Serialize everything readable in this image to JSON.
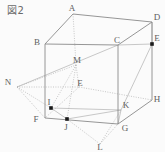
{
  "figure": {
    "caption": "図2",
    "type": "geometry-diagram",
    "shape": "cube with inscribed construction lines",
    "stroke_color": "#8a8a8a",
    "dotted_color": "#b0b0b0",
    "dot_color": "#1a1a1a",
    "background": "#fbfbfb",
    "width": 165,
    "height": 152
  },
  "vertices": [
    {
      "id": "A",
      "label": "A",
      "x": 73,
      "y": 14,
      "lx": 72,
      "ly": 8,
      "marked": false
    },
    {
      "id": "B",
      "label": "B",
      "x": 45,
      "y": 44,
      "lx": 37,
      "ly": 42,
      "marked": false
    },
    {
      "id": "C",
      "label": "C",
      "x": 118,
      "y": 45,
      "lx": 117,
      "ly": 40,
      "marked": false
    },
    {
      "id": "D",
      "label": "D",
      "x": 152,
      "y": 22,
      "lx": 157,
      "ly": 17,
      "marked": false
    },
    {
      "id": "E",
      "label": "E",
      "x": 79,
      "y": 87,
      "lx": 80,
      "ly": 83,
      "marked": false
    },
    {
      "id": "F",
      "label": "F",
      "x": 45,
      "y": 118,
      "lx": 36,
      "ly": 119,
      "marked": false
    },
    {
      "id": "G",
      "label": "G",
      "x": 118,
      "y": 124,
      "lx": 125,
      "ly": 128,
      "marked": false
    },
    {
      "id": "H",
      "label": "H",
      "x": 152,
      "y": 100,
      "lx": 157,
      "ly": 99,
      "marked": false
    },
    {
      "id": "M",
      "label": "M",
      "x": 76,
      "y": 65,
      "lx": 77,
      "ly": 60,
      "marked": false
    },
    {
      "id": "N",
      "label": "N",
      "x": 17,
      "y": 87,
      "lx": 8,
      "ly": 82,
      "marked": false
    },
    {
      "id": "I",
      "label": "I",
      "x": 51,
      "y": 108,
      "lx": 49,
      "ly": 102,
      "marked": true
    },
    {
      "id": "J",
      "label": "J",
      "x": 67,
      "y": 119,
      "lx": 66,
      "ly": 127,
      "marked": true
    },
    {
      "id": "K",
      "label": "K",
      "x": 121,
      "y": 110,
      "lx": 126,
      "ly": 105,
      "marked": false
    },
    {
      "id": "L",
      "label": "L",
      "x": 100,
      "y": 144,
      "lx": 100,
      "ly": 147,
      "marked": false
    },
    {
      "id": "P",
      "label": "E",
      "x": 152,
      "y": 44,
      "lx": 157,
      "ly": 38,
      "marked": true
    }
  ],
  "edges": {
    "solid": [
      {
        "from": "A",
        "to": "B",
        "name": "edge-A-B"
      },
      {
        "from": "A",
        "to": "D",
        "name": "edge-A-D"
      },
      {
        "from": "B",
        "to": "C",
        "name": "edge-B-C"
      },
      {
        "from": "C",
        "to": "D",
        "name": "edge-C-D"
      },
      {
        "from": "B",
        "to": "F",
        "name": "edge-B-F"
      },
      {
        "from": "C",
        "to": "G",
        "name": "edge-C-G"
      },
      {
        "from": "D",
        "to": "H",
        "name": "edge-D-H"
      },
      {
        "from": "F",
        "to": "G",
        "name": "edge-F-G"
      },
      {
        "from": "G",
        "to": "H",
        "name": "edge-G-H"
      }
    ],
    "dotted": [
      {
        "from": "A",
        "to": "M",
        "name": "edge-A-M"
      },
      {
        "from": "M",
        "to": "E",
        "name": "edge-M-E"
      },
      {
        "from": "E",
        "to": "F",
        "name": "edge-E-F"
      },
      {
        "from": "E",
        "to": "H",
        "name": "edge-E-H"
      },
      {
        "from": "N",
        "to": "E",
        "name": "edge-N-E"
      },
      {
        "from": "N",
        "to": "F",
        "name": "edge-N-F"
      },
      {
        "from": "N",
        "to": "I",
        "name": "edge-N-I"
      },
      {
        "from": "N",
        "to": "M",
        "name": "edge-N-M"
      },
      {
        "from": "M",
        "to": "I",
        "name": "edge-M-I"
      },
      {
        "from": "M",
        "to": "J",
        "name": "edge-M-J"
      },
      {
        "from": "L",
        "to": "J",
        "name": "edge-L-J"
      },
      {
        "from": "L",
        "to": "K",
        "name": "edge-L-K"
      },
      {
        "from": "L",
        "to": "G",
        "name": "edge-L-G"
      }
    ],
    "construction": [
      {
        "from": "N",
        "to": "C",
        "name": "line-N-C"
      },
      {
        "from": "I",
        "to": "J",
        "name": "line-I-J"
      },
      {
        "from": "I",
        "to": "K",
        "name": "line-I-K"
      },
      {
        "from": "J",
        "to": "K",
        "name": "line-J-K"
      },
      {
        "from": "K",
        "to": "P",
        "name": "line-K-E"
      },
      {
        "from": "C",
        "to": "P",
        "name": "line-C-E"
      },
      {
        "from": "D",
        "to": "P",
        "name": "line-D-E"
      },
      {
        "from": "K",
        "to": "G",
        "name": "line-K-G"
      }
    ]
  }
}
